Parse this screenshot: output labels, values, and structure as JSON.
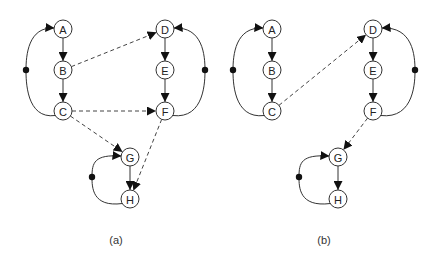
{
  "figure": {
    "panels": [
      {
        "id": "a",
        "caption": "(a)",
        "caption_pos": [
          116,
          244
        ],
        "nodes": [
          {
            "id": "A",
            "label": "A",
            "x": 63,
            "y": 29
          },
          {
            "id": "B",
            "label": "B",
            "x": 63,
            "y": 70
          },
          {
            "id": "C",
            "label": "C",
            "x": 63,
            "y": 111
          },
          {
            "id": "D",
            "label": "D",
            "x": 165,
            "y": 29
          },
          {
            "id": "E",
            "label": "E",
            "x": 165,
            "y": 70
          },
          {
            "id": "F",
            "label": "F",
            "x": 165,
            "y": 111
          },
          {
            "id": "G",
            "label": "G",
            "x": 130,
            "y": 157
          },
          {
            "id": "H",
            "label": "H",
            "x": 130,
            "y": 199
          }
        ],
        "solid_edges": [
          [
            "A",
            "B"
          ],
          [
            "B",
            "C"
          ],
          [
            "D",
            "E"
          ],
          [
            "E",
            "F"
          ],
          [
            "G",
            "H"
          ]
        ],
        "loops": [
          {
            "from": "C",
            "to": "A",
            "dot": [
              26,
              70
            ],
            "side": "left"
          },
          {
            "from": "F",
            "to": "D",
            "dot": [
              205,
              70
            ],
            "side": "right"
          },
          {
            "from": "H",
            "to": "G",
            "dot": [
              92,
              177
            ],
            "side": "left"
          }
        ],
        "dashed_edges": [
          [
            "B",
            "D"
          ],
          [
            "C",
            "F"
          ],
          [
            "C",
            "G"
          ],
          [
            "F",
            "H"
          ]
        ]
      },
      {
        "id": "b",
        "caption": "(b)",
        "caption_pos": [
          324,
          244
        ],
        "nodes": [
          {
            "id": "A",
            "label": "A",
            "x": 272,
            "y": 29
          },
          {
            "id": "B",
            "label": "B",
            "x": 272,
            "y": 70
          },
          {
            "id": "C",
            "label": "C",
            "x": 272,
            "y": 111
          },
          {
            "id": "D",
            "label": "D",
            "x": 373,
            "y": 29
          },
          {
            "id": "E",
            "label": "E",
            "x": 373,
            "y": 70
          },
          {
            "id": "F",
            "label": "F",
            "x": 373,
            "y": 111
          },
          {
            "id": "G",
            "label": "G",
            "x": 338,
            "y": 157
          },
          {
            "id": "H",
            "label": "H",
            "x": 338,
            "y": 199
          }
        ],
        "solid_edges": [
          [
            "A",
            "B"
          ],
          [
            "B",
            "C"
          ],
          [
            "D",
            "E"
          ],
          [
            "E",
            "F"
          ],
          [
            "G",
            "H"
          ]
        ],
        "loops": [
          {
            "from": "C",
            "to": "A",
            "dot": [
              233,
              70
            ],
            "side": "left"
          },
          {
            "from": "F",
            "to": "D",
            "dot": [
              415,
              70
            ],
            "side": "right"
          },
          {
            "from": "H",
            "to": "G",
            "dot": [
              299,
              177
            ],
            "side": "left"
          }
        ],
        "dashed_edges": [
          [
            "C",
            "D"
          ],
          [
            "F",
            "G"
          ]
        ]
      }
    ],
    "node_radius": 9
  }
}
